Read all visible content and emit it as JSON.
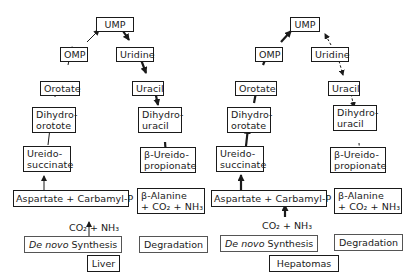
{
  "panels": [
    {
      "tissue": "Liver",
      "nodes": {
        "ump": "UMP",
        "omp": "OMP",
        "uridine": "Uridine",
        "orotate": "Orotate",
        "uracil": "Uracil",
        "dihydroorotate_1": "Dihydro-",
        "dihydroorotate_2": "orotote",
        "dihydrouracil_1": "Dihydro-",
        "dihydrouracil_2": "uracil",
        "ureidosuccinate_1": "Ureido-",
        "ureidosuccinate_2": "succinate",
        "ureidopropionate_1": "β-Ureido-",
        "ureidopropionate_2": "propionate",
        "aspartate_carbamyl": "Aspartate + Carbamyl-P",
        "alanine_1": "β-Alanine",
        "alanine_2": "+ CO₂ + NH₃",
        "co2_nh3": "CO₂ + NH₃"
      },
      "synthesis_label_italic": "De novo",
      "synthesis_label_rest": " Synthesis",
      "degradation_label": "Degradation",
      "synthesis_arrow_style": "thin",
      "degradation_arrow_style": "thick"
    },
    {
      "tissue": "Hepatomas",
      "nodes": {
        "ump": "UMP",
        "omp": "OMP",
        "uridine": "Uridine",
        "orotate": "Orotate",
        "uracil": "Uracil",
        "dihydroorotate_1": "Dihydro-",
        "dihydroorotate_2": "orotate",
        "dihydrouracil_1": "Dihydro-",
        "dihydrouracil_2": "uracil",
        "ureidosuccinate_1": "Ureido-",
        "ureidosuccinate_2": "succinate",
        "ureidopropionate_1": "β-Ureido-",
        "ureidopropionate_2": "propionate",
        "aspartate_carbamyl": "Aspartate + Carbamyl-P",
        "alanine_1": "β-Alanine",
        "alanine_2": "+ CO₂ + NH₃",
        "co2_nh3": "CO₂ + NH₃"
      },
      "synthesis_label_italic": "De novo",
      "synthesis_label_rest": " Synthesis",
      "degradation_label": "Degradation",
      "synthesis_arrow_style": "thick",
      "degradation_arrow_style": "dashed"
    }
  ]
}
